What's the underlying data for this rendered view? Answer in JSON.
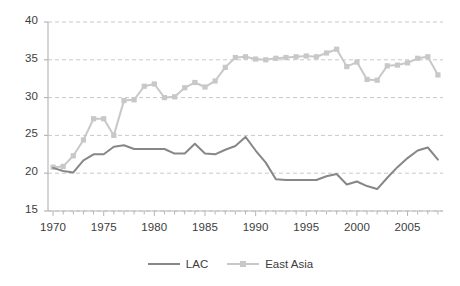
{
  "chart_data": {
    "type": "line",
    "title": "",
    "subtitle": "",
    "xlabel": "",
    "ylabel": "",
    "xlim": [
      1969.5,
      2008.5
    ],
    "ylim": [
      15,
      40
    ],
    "grid": true,
    "grid_axis": "y",
    "legend_position": "bottom-center",
    "x": [
      1970,
      1971,
      1972,
      1973,
      1974,
      1975,
      1976,
      1977,
      1978,
      1979,
      1980,
      1981,
      1982,
      1983,
      1984,
      1985,
      1986,
      1987,
      1988,
      1989,
      1990,
      1991,
      1992,
      1993,
      1994,
      1995,
      1996,
      1997,
      1998,
      1999,
      2000,
      2001,
      2002,
      2003,
      2004,
      2005,
      2006,
      2007,
      2008
    ],
    "xticks": [
      1970,
      1975,
      1980,
      1985,
      1990,
      1995,
      2000,
      2005
    ],
    "xtick_labels": [
      "1970",
      "1975",
      "1980",
      "1985",
      "1990",
      "1995",
      "2000",
      "2005"
    ],
    "yticks": [
      15,
      20,
      25,
      30,
      35,
      40
    ],
    "ytick_labels": [
      "15",
      "20",
      "25",
      "30",
      "35",
      "40"
    ],
    "series": [
      {
        "name": "LAC",
        "color": "#878787",
        "marker": "none",
        "values": [
          20.7,
          20.3,
          20.1,
          21.7,
          22.5,
          22.5,
          23.5,
          23.7,
          23.2,
          23.2,
          23.2,
          23.2,
          22.6,
          22.6,
          23.9,
          22.6,
          22.5,
          23.1,
          23.6,
          24.8,
          23.0,
          21.4,
          19.2,
          19.1,
          19.1,
          19.1,
          19.1,
          19.6,
          19.9,
          18.5,
          18.9,
          18.3,
          17.9,
          19.4,
          20.8,
          22.0,
          23.0,
          23.4,
          21.8
        ],
        "line_style": "solid",
        "line_width": 2
      },
      {
        "name": "East Asia",
        "color": "#c8c8c8",
        "marker": "square",
        "values": [
          20.8,
          20.9,
          22.3,
          24.4,
          27.2,
          27.2,
          25.0,
          29.6,
          29.7,
          31.5,
          31.8,
          30.0,
          30.1,
          31.3,
          32.0,
          31.4,
          32.2,
          34.0,
          35.3,
          35.4,
          35.1,
          35.0,
          35.2,
          35.3,
          35.4,
          35.5,
          35.4,
          35.9,
          36.4,
          34.1,
          34.7,
          32.4,
          32.3,
          34.2,
          34.3,
          34.6,
          35.2,
          35.4,
          33.0
        ],
        "line_style": "solid",
        "line_width": 2
      }
    ]
  },
  "legend": {
    "items": [
      {
        "label": "LAC",
        "color": "#878787",
        "marker": "none"
      },
      {
        "label": "East Asia",
        "color": "#c8c8c8",
        "marker": "square"
      }
    ]
  },
  "axes": {
    "axis_color": "#b7b7b7",
    "grid_color": "#c9c9c9",
    "tick_label_color": "#3c3c3c"
  }
}
